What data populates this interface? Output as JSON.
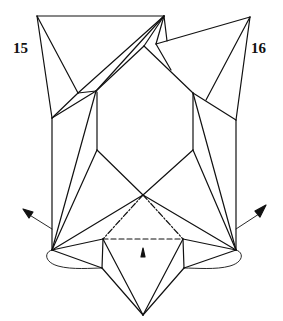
{
  "steps": {
    "left": {
      "number": "15"
    },
    "right": {
      "number": "16"
    }
  },
  "diagram": {
    "symbols": [
      "valley-fold-line",
      "mountain-fold-line",
      "push-arrow",
      "rotation-arrow-left",
      "rotation-arrow-right"
    ],
    "colors": {
      "line": "#111111",
      "background": "#ffffff"
    }
  }
}
